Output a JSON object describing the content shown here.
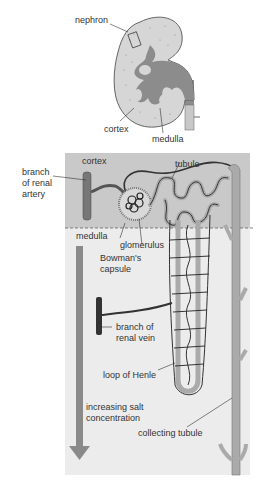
{
  "kidney": {
    "labels": {
      "nephron": "nephron",
      "cortex": "cortex",
      "medulla": "medulla"
    }
  },
  "nephron_detail": {
    "regions": {
      "cortex": "cortex",
      "medulla": "medulla"
    },
    "labels": {
      "branch_artery_1": "branch",
      "branch_artery_2": "of renal",
      "branch_artery_3": "artery",
      "tubule": "tubule",
      "glomerulus": "glomerulus",
      "bowmans_1": "Bowman's",
      "bowmans_2": "capsule",
      "branch_vein_1": "branch of",
      "branch_vein_2": "renal vein",
      "loop_of_henle": "loop of Henle",
      "salt_1": "increasing salt",
      "salt_2": "concentration",
      "collecting_tubule": "collecting tubule"
    }
  },
  "colors": {
    "cortex_bg": "#c9c9c9",
    "medulla_bg": "#ececec",
    "kidney_fill": "#8c8c8c",
    "kidney_cortex": "#d8d8d8",
    "vessel_dark": "#333333",
    "arrow": "#8a8a8a"
  }
}
